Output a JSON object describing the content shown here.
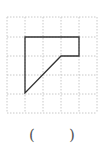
{
  "diagram": {
    "type": "grid-shape",
    "grid": {
      "columns": 5,
      "rows": 5,
      "line_style": "dotted",
      "line_color": "#c8c8c8"
    },
    "shape": {
      "description": "polygon drawn on square grid",
      "vertices_grid_units": [
        [
          1,
          1
        ],
        [
          4,
          1
        ],
        [
          4,
          2
        ],
        [
          3,
          2
        ],
        [
          1,
          4
        ]
      ],
      "stroke_color": "#333333"
    }
  },
  "answer": {
    "open_paren": "(",
    "blank": "",
    "close_paren": ")"
  }
}
